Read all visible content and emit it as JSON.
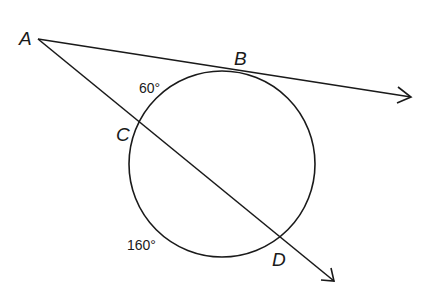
{
  "diagram": {
    "type": "circle-secant-tangent",
    "points": {
      "A": "A",
      "B": "B",
      "C": "C",
      "D": "D"
    },
    "arcs": {
      "arc_BC": "60°",
      "arc_CD": "160°"
    },
    "colors": {
      "stroke": "#1a1a1a",
      "background": "#ffffff"
    }
  }
}
